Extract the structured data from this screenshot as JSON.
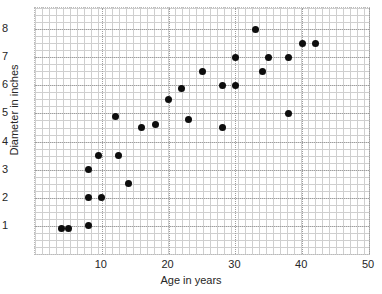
{
  "chart_data": {
    "type": "scatter",
    "title": "",
    "xlabel": "Age in years",
    "ylabel": "Diameter in inches",
    "xlim": [
      0,
      50
    ],
    "ylim": [
      0,
      8.75
    ],
    "xticks": [
      10,
      20,
      30,
      40,
      50
    ],
    "yticks": [
      1,
      2,
      3,
      4,
      5,
      6,
      7,
      8
    ],
    "grid": true,
    "legend": null,
    "series": [
      {
        "name": "Tree measurements",
        "marker": "filled-circle",
        "color": "#0d0d0d",
        "points": [
          {
            "x": 4,
            "y": 0.9
          },
          {
            "x": 5,
            "y": 0.9
          },
          {
            "x": 8,
            "y": 1.0
          },
          {
            "x": 8,
            "y": 2.0
          },
          {
            "x": 10,
            "y": 2.0
          },
          {
            "x": 8,
            "y": 3.0
          },
          {
            "x": 9.5,
            "y": 3.5
          },
          {
            "x": 12.5,
            "y": 3.5
          },
          {
            "x": 14,
            "y": 2.5
          },
          {
            "x": 12,
            "y": 4.9
          },
          {
            "x": 16,
            "y": 4.5
          },
          {
            "x": 18,
            "y": 4.6
          },
          {
            "x": 20,
            "y": 5.5
          },
          {
            "x": 22,
            "y": 5.9
          },
          {
            "x": 23,
            "y": 4.8
          },
          {
            "x": 25,
            "y": 6.5
          },
          {
            "x": 28,
            "y": 6.0
          },
          {
            "x": 28,
            "y": 4.5
          },
          {
            "x": 30,
            "y": 6.0
          },
          {
            "x": 30,
            "y": 7.0
          },
          {
            "x": 33,
            "y": 8.0
          },
          {
            "x": 34,
            "y": 6.5
          },
          {
            "x": 35,
            "y": 7.0
          },
          {
            "x": 38,
            "y": 7.0
          },
          {
            "x": 38,
            "y": 5.0
          },
          {
            "x": 40,
            "y": 7.5
          },
          {
            "x": 42,
            "y": 7.5
          }
        ]
      }
    ]
  }
}
